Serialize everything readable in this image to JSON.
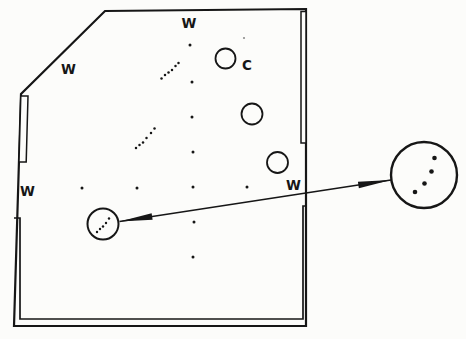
{
  "figure": {
    "colors": {
      "ink": "#161616",
      "paper": "#fcfcfa",
      "speck": "#8d8d8d"
    },
    "labels": {
      "w_diagonal": {
        "text": "W"
      },
      "w_top": {
        "text": "W"
      },
      "w_left": {
        "text": "W"
      },
      "w_right": {
        "text": "W"
      },
      "c_cup": {
        "text": "C"
      }
    },
    "cups": [
      {
        "cx": 225.5,
        "cy": 58.5,
        "r": 10
      },
      {
        "cx": 252,
        "cy": 114,
        "r": 10.5
      },
      {
        "cx": 277.5,
        "cy": 162.5,
        "r": 10.5
      }
    ],
    "highlight_circle": {
      "cx": 103,
      "cy": 224,
      "r": 15.5
    },
    "magnified_circle": {
      "cx": 424,
      "cy": 175,
      "r": 33
    },
    "arrow": {
      "x1": 119.5,
      "y1": 221.5,
      "x2": 391,
      "y2": 180,
      "head_length": 33,
      "head_half_width": 3.3,
      "double_headed": true
    },
    "dots": {
      "column": {
        "r": 1.5,
        "points": [
          [
            190,
            45
          ],
          [
            192,
            82
          ],
          [
            192,
            117
          ],
          [
            193,
            152
          ],
          [
            193,
            187
          ],
          [
            194,
            222
          ],
          [
            193,
            257
          ]
        ]
      },
      "row": {
        "r": 1.5,
        "points": [
          [
            82,
            188
          ],
          [
            137,
            188
          ],
          [
            247,
            187
          ]
        ]
      },
      "trail_upper": {
        "r": 1.25,
        "points": [
          [
            161.5,
            78.5
          ],
          [
            165,
            75
          ],
          [
            168.5,
            72.5
          ],
          [
            172,
            70
          ],
          [
            175.5,
            66
          ],
          [
            178.5,
            63
          ]
        ]
      },
      "trail_middle": {
        "r": 1.25,
        "points": [
          [
            136,
            148
          ],
          [
            139.5,
            145
          ],
          [
            143,
            142.5
          ],
          [
            146.5,
            138
          ],
          [
            151,
            133
          ],
          [
            154.5,
            128.5
          ]
        ]
      },
      "in_highlight": {
        "r": 1.2,
        "points": [
          [
            97,
            232
          ],
          [
            100,
            229
          ],
          [
            103,
            226.5
          ],
          [
            106,
            223
          ],
          [
            109,
            218.5
          ]
        ]
      },
      "in_magnified": {
        "r": 2.3,
        "points": [
          [
            415,
            192
          ],
          [
            424.5,
            183.5
          ],
          [
            431.5,
            171.5
          ],
          [
            434.5,
            158
          ]
        ]
      },
      "speck": {
        "r": 1.1,
        "color": "#8d8d8d",
        "points": [
          [
            244,
            38
          ]
        ]
      }
    }
  }
}
